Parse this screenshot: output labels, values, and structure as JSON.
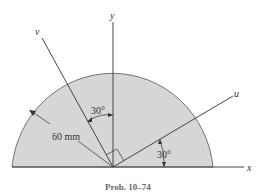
{
  "figure": {
    "axis_labels": {
      "x": "x",
      "y": "y",
      "u": "u",
      "v": "v"
    },
    "dimension_label": "60 mm",
    "angle_labels": {
      "v_from_y": "30°",
      "u_from_x": "30°"
    },
    "caption": "Prob. 10–74"
  },
  "colors": {
    "fill": "#d6d6d6",
    "stroke": "#444444",
    "background": "#ffffff"
  }
}
